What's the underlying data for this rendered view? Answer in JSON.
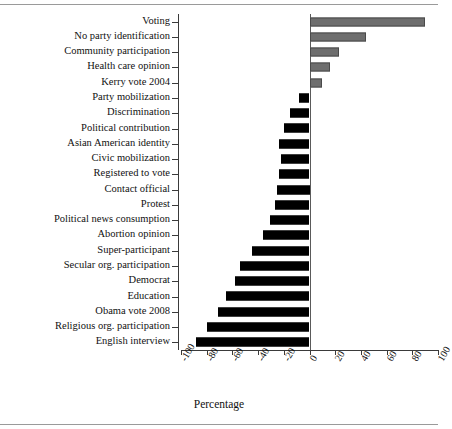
{
  "chart_data": {
    "type": "bar",
    "orientation": "horizontal",
    "title": "",
    "xlabel": "Percentage",
    "ylabel": "",
    "xlim": [
      -100,
      100
    ],
    "xticks": [
      -100,
      -80,
      -60,
      -40,
      -20,
      0,
      20,
      40,
      60,
      80,
      100
    ],
    "xtick_labels": [
      "-100",
      "-80",
      "-60",
      "-40",
      "-20",
      "0",
      "20",
      "40",
      "60",
      "80",
      "100"
    ],
    "grid": false,
    "legend": false,
    "zero_reference_line": true,
    "series_colors": {
      "positive": "#6e6e6e",
      "negative": "#000000",
      "axis": "#3a3a3a",
      "text": "#111111"
    },
    "categories": [
      "Voting",
      "No party identification",
      "Community participation",
      "Health care opinion",
      "Kerry vote 2004",
      "Party mobilization",
      "Discrimination",
      "Political contribution",
      "Asian American identity",
      "Civic mobilization",
      "Registered to vote",
      "Contact official",
      "Protest",
      "Political news consumption",
      "Abortion opinion",
      "Super-participant",
      "Secular org. participation",
      "Democrat",
      "Education",
      "Obama vote 2008",
      "Religious org. participation",
      "English interview"
    ],
    "values": [
      89.5,
      44.0,
      23.0,
      16.0,
      9.5,
      -8.0,
      -15.0,
      -20.0,
      -24.0,
      -22.0,
      -24.0,
      -25.0,
      -27.0,
      -31.0,
      -36.0,
      -45.0,
      -54.0,
      -58.0,
      -65.0,
      -71.0,
      -80.0,
      -88.0
    ]
  }
}
